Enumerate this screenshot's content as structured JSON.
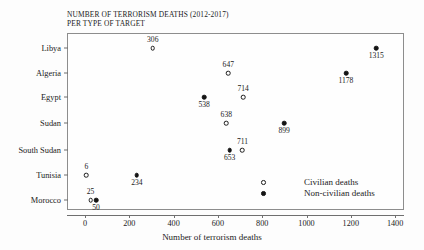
{
  "chart_data": {
    "type": "scatter",
    "title": "NUMBER OF TERRORISM DEATHS (2012-2017) PER TYPE OF TARGET",
    "title_line1": "NUMBER OF TERRORISM DEATHS (2012-2017)",
    "title_line2": "PER TYPE OF TARGET",
    "xlabel": "Number of terrorism deaths",
    "ylabel": "",
    "xlim": [
      -60,
      1460
    ],
    "xticks": [
      0,
      200,
      400,
      600,
      800,
      1000,
      1200,
      1400
    ],
    "xtick_labels": [
      "0",
      "200",
      "400",
      "600",
      "800",
      "1000",
      "1200",
      "1400"
    ],
    "categories": [
      "Libya",
      "Algeria",
      "Egypt",
      "Sudan",
      "South Sudan",
      "Tunisia",
      "Morocco"
    ],
    "grid": false,
    "legend_position": "inside-lower-right",
    "series": [
      {
        "name": "Civilian deaths",
        "marker": "open-circle",
        "color": "#ffffff",
        "edge_color": "#1a1a1a",
        "values": [
          306,
          647,
          714,
          638,
          711,
          6,
          25
        ]
      },
      {
        "name": "Non-civilian deaths",
        "marker": "filled-circle",
        "color": "#141414",
        "edge_color": "#141414",
        "values": [
          1315,
          1178,
          538,
          899,
          653,
          234,
          50
        ]
      }
    ],
    "points": [
      {
        "category": "Libya",
        "row": 0,
        "series": "Civilian deaths",
        "value": 306,
        "label": "306",
        "label_pos": "above"
      },
      {
        "category": "Libya",
        "row": 0,
        "series": "Non-civilian deaths",
        "value": 1315,
        "label": "1315",
        "label_pos": "below"
      },
      {
        "category": "Algeria",
        "row": 1,
        "series": "Civilian deaths",
        "value": 647,
        "label": "647",
        "label_pos": "above"
      },
      {
        "category": "Algeria",
        "row": 1,
        "series": "Non-civilian deaths",
        "value": 1178,
        "label": "1178",
        "label_pos": "below"
      },
      {
        "category": "Egypt",
        "row": 2,
        "series": "Civilian deaths",
        "value": 714,
        "label": "714",
        "label_pos": "above"
      },
      {
        "category": "Egypt",
        "row": 2,
        "series": "Non-civilian deaths",
        "value": 538,
        "label": "538",
        "label_pos": "below"
      },
      {
        "category": "Sudan",
        "row": 3,
        "series": "Civilian deaths",
        "value": 638,
        "label": "638",
        "label_pos": "above"
      },
      {
        "category": "Sudan",
        "row": 3,
        "series": "Non-civilian deaths",
        "value": 899,
        "label": "899",
        "label_pos": "below"
      },
      {
        "category": "South Sudan",
        "row": 4,
        "series": "Civilian deaths",
        "value": 711,
        "label": "711",
        "label_pos": "above"
      },
      {
        "category": "South Sudan",
        "row": 4,
        "series": "Non-civilian deaths",
        "value": 653,
        "label": "653",
        "label_pos": "below"
      },
      {
        "category": "Tunisia",
        "row": 5,
        "series": "Civilian deaths",
        "value": 6,
        "label": "6",
        "label_pos": "above"
      },
      {
        "category": "Tunisia",
        "row": 5,
        "series": "Non-civilian deaths",
        "value": 234,
        "label": "234",
        "label_pos": "below"
      },
      {
        "category": "Morocco",
        "row": 6,
        "series": "Civilian deaths",
        "value": 25,
        "label": "25",
        "label_pos": "above"
      },
      {
        "category": "Morocco",
        "row": 6,
        "series": "Non-civilian deaths",
        "value": 50,
        "label": "50",
        "label_pos": "below"
      }
    ]
  },
  "legend": {
    "items": [
      {
        "label": "Civilian deaths",
        "marker": "open-circle"
      },
      {
        "label": "Non-civilian deaths",
        "marker": "filled-circle"
      }
    ]
  }
}
